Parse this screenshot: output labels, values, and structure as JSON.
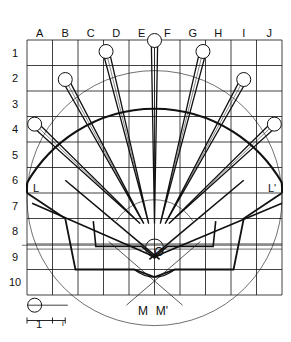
{
  "diagram": {
    "type": "geometric construction",
    "columns": [
      "A",
      "B",
      "C",
      "D",
      "E",
      "F",
      "G",
      "H",
      "I",
      "J"
    ],
    "rows": [
      "1",
      "2",
      "3",
      "4",
      "5",
      "6",
      "7",
      "8",
      "9",
      "10"
    ],
    "grid": {
      "x0": 27,
      "y0": 40,
      "cell": 25.5,
      "ncols": 10,
      "nrows": 10
    },
    "points": {
      "L": "L",
      "L_prime": "L'",
      "O": "O",
      "M": "M",
      "M_prime": "M'"
    },
    "scale_bar": {
      "major": "1",
      "minor": "i"
    },
    "fraction_marks": {
      "left": "i/3",
      "right": "i"
    },
    "stroke_color": "#111111",
    "background": "#ffffff"
  }
}
